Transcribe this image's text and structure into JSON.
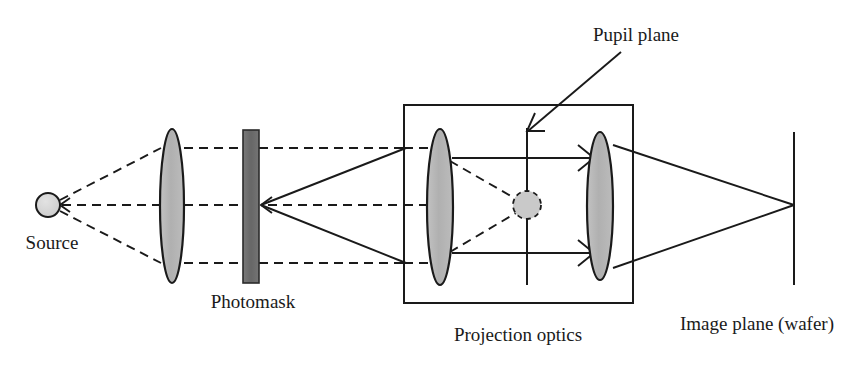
{
  "figure": {
    "type": "optical-ray-diagram",
    "width": 846,
    "height": 374,
    "background_color": "#ffffff"
  },
  "labels": {
    "source": "Source",
    "photomask": "Photomask",
    "pupil_plane": "Pupil plane",
    "projection_optics": "Projection optics",
    "image_plane": "Image plane (wafer)"
  },
  "colors": {
    "stroke": "#1a1a1a",
    "lens_fill": "#b5b5b5",
    "source_fill": "#d3d3d3",
    "photomask_fill": "#6e6e6e",
    "pupil_fill": "#c9c9c9",
    "text": "#1a1a1a"
  },
  "components": {
    "source": {
      "name": "Source",
      "shape": "circle",
      "cx": 48,
      "cy": 205,
      "r": 12,
      "label_x": 52,
      "label_y": 249
    },
    "condenser_lens": {
      "name": "Condenser lens",
      "shape": "lens-ellipse",
      "cx": 172,
      "cy": 206,
      "rx": 12,
      "ry": 77
    },
    "photomask": {
      "name": "Photomask",
      "shape": "rect",
      "x": 243,
      "y": 130,
      "width": 16,
      "height": 153,
      "label_x": 253,
      "label_y": 308
    },
    "projection_box": {
      "name": "Projection optics enclosure",
      "shape": "rect",
      "x": 404,
      "y": 105,
      "width": 229,
      "height": 198,
      "label_x": 518,
      "label_y": 341
    },
    "projection_lens_left": {
      "name": "First projection lens",
      "shape": "lens-ellipse",
      "cx": 440,
      "cy": 207,
      "rx": 13,
      "ry": 78
    },
    "pupil_plane_line": {
      "name": "Pupil plane",
      "shape": "line",
      "x": 527,
      "y1": 128,
      "y2": 285,
      "label_x": 635,
      "label_y": 40,
      "leader_x1": 620,
      "leader_y1": 52,
      "leader_x2": 527,
      "leader_y2": 130
    },
    "pupil_aperture": {
      "name": "Pupil aperture spot",
      "shape": "dashed-circle",
      "cx": 527,
      "cy": 205,
      "r": 14
    },
    "projection_lens_right": {
      "name": "Second projection lens",
      "shape": "lens-ellipse",
      "cx": 600,
      "cy": 206,
      "rx": 13,
      "ry": 74
    },
    "image_plane": {
      "name": "Image plane (wafer)",
      "shape": "line",
      "x": 794,
      "y1": 132,
      "y2": 285,
      "label_x": 758,
      "label_y": 330
    }
  },
  "rays": {
    "illumination_dashed": [
      {
        "name": "source-to-lens-top",
        "points": "48,205 161,148"
      },
      {
        "name": "source-to-lens-axis",
        "points": "48,205 161,205"
      },
      {
        "name": "source-to-lens-bottom",
        "points": "48,205 161,263"
      },
      {
        "name": "lens-to-mask-top",
        "points": "184,148 243,148"
      },
      {
        "name": "lens-to-mask-axis",
        "points": "184,205 243,205"
      },
      {
        "name": "lens-to-mask-bottom",
        "points": "184,263 243,263"
      },
      {
        "name": "mask-to-box-top",
        "points": "259,148 404,148"
      },
      {
        "name": "mask-to-box-axis",
        "points": "259,205 404,205"
      },
      {
        "name": "mask-to-box-bottom",
        "points": "259,263 404,263"
      },
      {
        "name": "box-to-lens-top",
        "points": "404,148 428,148"
      },
      {
        "name": "box-to-lens-axis",
        "points": "404,205 428,205"
      },
      {
        "name": "box-to-lens-bottom",
        "points": "404,263 428,263"
      },
      {
        "name": "lens-to-pupil-upper",
        "points": "450,160 515,200"
      },
      {
        "name": "lens-to-pupil-lower",
        "points": "450,252 515,212"
      }
    ],
    "diffracted_solid": [
      {
        "name": "mask-diffract-up",
        "points": "259,205 404,148"
      },
      {
        "name": "mask-diffract-down",
        "points": "259,205 404,263"
      },
      {
        "name": "pupil-ray-top",
        "points": "452,158 592,158"
      },
      {
        "name": "pupil-ray-bottom",
        "points": "452,253 592,253"
      },
      {
        "name": "exit-ray-top",
        "points": "613,145 794,205"
      },
      {
        "name": "exit-ray-bottom",
        "points": "613,268 794,205"
      }
    ],
    "arrowheads": [
      {
        "name": "arrowhead-source",
        "x": 70,
        "y": 205,
        "dir": "left"
      },
      {
        "name": "arrowhead-mask",
        "x": 262,
        "y": 205,
        "dir": "left"
      },
      {
        "name": "arrowhead-pupil-top",
        "x": 592,
        "y": 158,
        "dir": "right"
      },
      {
        "name": "arrowhead-pupil-bottom",
        "x": 592,
        "y": 253,
        "dir": "right"
      },
      {
        "name": "arrowhead-pupil-leader",
        "x": 527,
        "y": 131,
        "dir": "down-left"
      }
    ]
  }
}
